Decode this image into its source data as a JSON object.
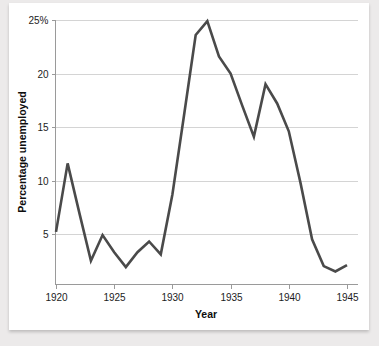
{
  "card": {
    "background_color": "#ffffff",
    "page_background_color": "#eceaea"
  },
  "chart_data": {
    "type": "line",
    "title": "",
    "xlabel": "Year",
    "ylabel": "Percentage unemployed",
    "xlim": [
      1920,
      1945
    ],
    "ylim": [
      0.6,
      25.9
    ],
    "grid": true,
    "legend": "none",
    "line_color": "#4a4a4a",
    "gridline_color": "#d4d4d4",
    "x_ticks": [
      1920,
      1925,
      1930,
      1935,
      1940,
      1945
    ],
    "x_tick_labels": [
      "1920",
      "1925",
      "1930",
      "1935",
      "1940",
      "1945"
    ],
    "y_ticks": [
      5,
      10,
      15,
      20,
      25
    ],
    "y_tick_labels": [
      "5",
      "10",
      "15",
      "20",
      "25%"
    ],
    "series": [
      {
        "name": "Percentage unemployed",
        "x": [
          1920,
          1921,
          1922,
          1923,
          1924,
          1925,
          1926,
          1927,
          1928,
          1929,
          1930,
          1931,
          1932,
          1933,
          1934,
          1935,
          1936,
          1937,
          1938,
          1939,
          1940,
          1941,
          1942,
          1943,
          1944,
          1945
        ],
        "values": [
          5.2,
          11.6,
          7.0,
          2.5,
          4.9,
          3.3,
          1.9,
          3.3,
          4.3,
          3.1,
          8.7,
          16.1,
          23.6,
          24.9,
          21.6,
          20.0,
          17.0,
          14.1,
          19.0,
          17.2,
          14.6,
          9.8,
          4.5,
          2.0,
          1.5,
          2.1
        ]
      }
    ]
  }
}
